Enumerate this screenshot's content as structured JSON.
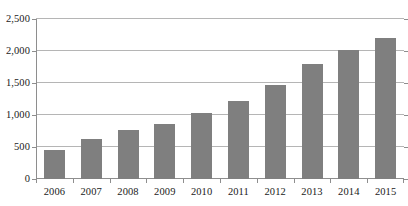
{
  "chart_data": {
    "type": "bar",
    "title": "",
    "subtitle": "",
    "xlabel": "",
    "ylabel": "",
    "categories": [
      "2006",
      "2007",
      "2008",
      "2009",
      "2010",
      "2011",
      "2012",
      "2013",
      "2014",
      "2015"
    ],
    "values": [
      450,
      620,
      770,
      860,
      1030,
      1220,
      1470,
      1790,
      2010,
      2210
    ],
    "series": [
      {
        "name": "",
        "values": [
          450,
          620,
          770,
          860,
          1030,
          1220,
          1470,
          1790,
          2010,
          2210
        ]
      }
    ],
    "ylim": [
      0,
      2500
    ],
    "ytick_values": [
      0,
      500,
      1000,
      1500,
      2000,
      2500
    ],
    "ytick_labels": [
      "0",
      "500",
      "1,000",
      "1,500",
      "2,000",
      "2,500"
    ],
    "xtick_labels": [
      "2006",
      "2007",
      "2008",
      "2009",
      "2010",
      "2011",
      "2012",
      "2013",
      "2014",
      "2015"
    ],
    "grid": true,
    "grid_axis": "y",
    "legend": false,
    "legend_position": "none",
    "annotations": [],
    "colors": {
      "bar": "#7f7f7f",
      "gridline": "#b5b5b5",
      "axis": "#8e8e8e",
      "background": "#ffffff",
      "text": "#1a1a1a"
    }
  }
}
